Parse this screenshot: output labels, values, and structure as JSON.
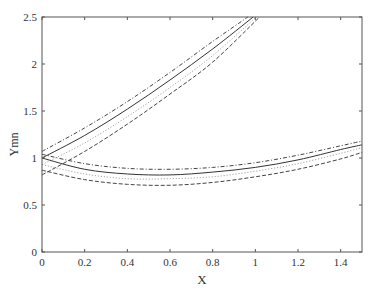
{
  "chart_data": {
    "type": "line",
    "title": "",
    "xlabel": "X",
    "ylabel": "Ymn",
    "xlim": [
      0,
      1.5
    ],
    "ylim": [
      0,
      2.5
    ],
    "grid": false,
    "legend": null,
    "x_ticks": [
      0,
      0.2,
      0.4,
      0.6,
      0.8,
      1,
      1.2,
      1.4
    ],
    "x_tick_labels": [
      "0",
      "0.2",
      "0.4",
      "0.6",
      "0.8",
      "1",
      "1.2",
      "1.4"
    ],
    "y_ticks": [
      0,
      0.5,
      1,
      1.5,
      2,
      2.5
    ],
    "y_tick_labels": [
      "0",
      "0.5",
      "1",
      "1.5",
      "2",
      "2.5"
    ],
    "series": [
      {
        "name": "upper-solid",
        "style": "solid",
        "color": "#333333",
        "x": [
          0,
          0.2,
          0.4,
          0.6,
          0.8,
          0.99
        ],
        "y": [
          1.0,
          1.24,
          1.52,
          1.83,
          2.16,
          2.5
        ]
      },
      {
        "name": "upper-dashdot",
        "style": "dashdot",
        "color": "#444444",
        "x": [
          0,
          0.2,
          0.4,
          0.6,
          0.8,
          0.965
        ],
        "y": [
          1.07,
          1.32,
          1.6,
          1.91,
          2.24,
          2.5
        ]
      },
      {
        "name": "upper-dotted",
        "style": "dotted",
        "color": "#999999",
        "x": [
          0,
          0.2,
          0.4,
          0.6,
          0.8,
          1.005
        ],
        "y": [
          0.93,
          1.16,
          1.44,
          1.75,
          2.09,
          2.5
        ]
      },
      {
        "name": "upper-dashed",
        "style": "dashed",
        "color": "#444444",
        "x": [
          0,
          0.2,
          0.4,
          0.6,
          0.8,
          1.02
        ],
        "y": [
          0.82,
          1.07,
          1.36,
          1.68,
          2.02,
          2.5
        ]
      },
      {
        "name": "lower-solid",
        "style": "solid",
        "color": "#333333",
        "x": [
          0,
          0.2,
          0.4,
          0.6,
          0.8,
          1.0,
          1.2,
          1.4,
          1.5
        ],
        "y": [
          1.0,
          0.88,
          0.83,
          0.82,
          0.85,
          0.9,
          0.98,
          1.09,
          1.14
        ]
      },
      {
        "name": "lower-dashdot",
        "style": "dashdot",
        "color": "#444444",
        "x": [
          0,
          0.2,
          0.4,
          0.6,
          0.8,
          1.0,
          1.2,
          1.4,
          1.5
        ],
        "y": [
          1.04,
          0.94,
          0.89,
          0.88,
          0.9,
          0.95,
          1.03,
          1.13,
          1.18
        ]
      },
      {
        "name": "lower-dotted",
        "style": "dotted",
        "color": "#999999",
        "x": [
          0,
          0.2,
          0.4,
          0.6,
          0.8,
          1.0,
          1.2,
          1.4,
          1.5
        ],
        "y": [
          0.93,
          0.83,
          0.78,
          0.78,
          0.8,
          0.86,
          0.94,
          1.05,
          1.11
        ]
      },
      {
        "name": "lower-dashed",
        "style": "dashed",
        "color": "#444444",
        "x": [
          0,
          0.2,
          0.4,
          0.6,
          0.8,
          1.0,
          1.2,
          1.4,
          1.5
        ],
        "y": [
          0.87,
          0.77,
          0.72,
          0.71,
          0.74,
          0.8,
          0.88,
          0.99,
          1.06
        ]
      }
    ]
  },
  "plot_area": {
    "left": 42,
    "top": 17,
    "right": 362,
    "bottom": 252
  }
}
